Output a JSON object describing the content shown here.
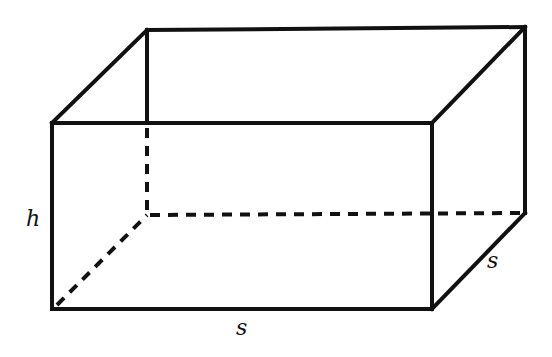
{
  "figure": {
    "type": "rectangular-prism",
    "labels": {
      "height": "h",
      "length": "s",
      "depth": "s"
    },
    "colors": {
      "stroke": "#111111",
      "background": "#ffffff"
    }
  }
}
